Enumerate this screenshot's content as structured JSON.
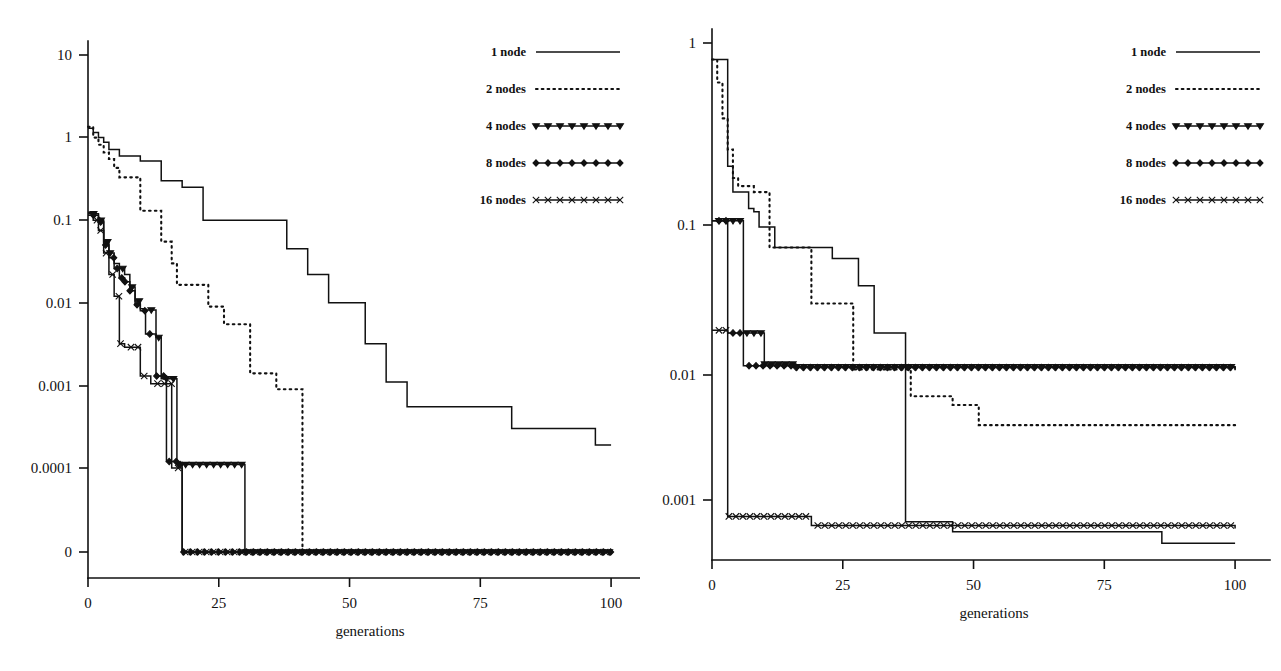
{
  "figure": {
    "background": "#ffffff",
    "ink": "#111111",
    "panels": [
      "left",
      "right"
    ]
  },
  "chart_data": [
    {
      "id": "left",
      "type": "line",
      "title": "",
      "xlabel": "generations",
      "ylabel": "",
      "xticks": [
        "0",
        "25",
        "50",
        "75",
        "100"
      ],
      "xtick_values": [
        0,
        25,
        50,
        75,
        100
      ],
      "xlim": [
        0,
        104
      ],
      "yticks": [
        "10",
        "1",
        "0.1",
        "0.01",
        "0.001",
        "0.0001",
        "0"
      ],
      "ytick_values": [
        10,
        1,
        0.1,
        0.01,
        0.001,
        0.0001,
        0
      ],
      "yscale": "log-with-zero",
      "grid": false,
      "legend_position": "top-right",
      "legend": [
        "1 node",
        "2 nodes",
        "4 nodes",
        "8 nodes",
        "16 nodes"
      ],
      "series": [
        {
          "name": "1 node",
          "style": "solid",
          "marker": "none",
          "points": [
            [
              0,
              1.3
            ],
            [
              1,
              1.15
            ],
            [
              2,
              1.0
            ],
            [
              3,
              0.88
            ],
            [
              4,
              0.72
            ],
            [
              6,
              0.6
            ],
            [
              9,
              0.6
            ],
            [
              10,
              0.52
            ],
            [
              13,
              0.52
            ],
            [
              14,
              0.3
            ],
            [
              17,
              0.3
            ],
            [
              18,
              0.25
            ],
            [
              21,
              0.25
            ],
            [
              22,
              0.1
            ],
            [
              37,
              0.1
            ],
            [
              38,
              0.045
            ],
            [
              41,
              0.045
            ],
            [
              42,
              0.022
            ],
            [
              45,
              0.022
            ],
            [
              46,
              0.01
            ],
            [
              52,
              0.01
            ],
            [
              53,
              0.0032
            ],
            [
              56,
              0.0032
            ],
            [
              57,
              0.0011
            ],
            [
              60,
              0.0011
            ],
            [
              61,
              0.00055
            ],
            [
              80,
              0.00055
            ],
            [
              81,
              0.0003
            ],
            [
              96,
              0.0003
            ],
            [
              97,
              0.00019
            ],
            [
              100,
              0.00019
            ]
          ]
        },
        {
          "name": "2 nodes",
          "style": "dotted",
          "marker": "none",
          "points": [
            [
              0,
              1.35
            ],
            [
              1,
              1.0
            ],
            [
              2,
              0.82
            ],
            [
              3,
              0.66
            ],
            [
              4,
              0.55
            ],
            [
              5,
              0.43
            ],
            [
              6,
              0.33
            ],
            [
              9,
              0.33
            ],
            [
              10,
              0.13
            ],
            [
              14,
              0.055
            ],
            [
              16,
              0.03
            ],
            [
              17,
              0.0165
            ],
            [
              22,
              0.0165
            ],
            [
              23,
              0.009
            ],
            [
              25,
              0.009
            ],
            [
              26,
              0.0055
            ],
            [
              30,
              0.0055
            ],
            [
              31,
              0.0014
            ],
            [
              35,
              0.0014
            ],
            [
              36,
              0.0009
            ],
            [
              40,
              0.0009
            ],
            [
              41,
              0.0
            ],
            [
              100,
              0.0
            ]
          ]
        },
        {
          "name": "4 nodes",
          "style": "marked",
          "marker": "triangle-down",
          "points": [
            [
              0,
              0.125
            ],
            [
              1,
              0.12
            ],
            [
              2,
              0.1
            ],
            [
              3,
              0.055
            ],
            [
              4,
              0.04
            ],
            [
              5,
              0.03
            ],
            [
              6,
              0.026
            ],
            [
              7,
              0.022
            ],
            [
              8,
              0.0155
            ],
            [
              9,
              0.0105
            ],
            [
              10,
              0.0085
            ],
            [
              11,
              0.0082
            ],
            [
              12,
              0.0082
            ],
            [
              13,
              0.0038
            ],
            [
              14,
              0.0012
            ],
            [
              16,
              0.0012
            ],
            [
              17,
              0.00011
            ],
            [
              28,
              0.00011
            ],
            [
              30,
              0.0
            ],
            [
              100,
              0.0
            ]
          ]
        },
        {
          "name": "8 nodes",
          "style": "marked",
          "marker": "diamond",
          "points": [
            [
              0,
              0.12
            ],
            [
              1,
              0.115
            ],
            [
              2,
              0.095
            ],
            [
              3,
              0.05
            ],
            [
              4,
              0.035
            ],
            [
              5,
              0.026
            ],
            [
              6,
              0.02
            ],
            [
              7,
              0.018
            ],
            [
              8,
              0.014
            ],
            [
              9,
              0.0095
            ],
            [
              10,
              0.008
            ],
            [
              11,
              0.0042
            ],
            [
              12,
              0.0042
            ],
            [
              13,
              0.0013
            ],
            [
              15,
              0.00012
            ],
            [
              17,
              0.00011
            ],
            [
              18,
              0.0
            ],
            [
              100,
              0.0
            ]
          ]
        },
        {
          "name": "16 nodes",
          "style": "marked",
          "marker": "cross",
          "points": [
            [
              0,
              0.115
            ],
            [
              1,
              0.1
            ],
            [
              2,
              0.075
            ],
            [
              3,
              0.04
            ],
            [
              4,
              0.022
            ],
            [
              5,
              0.012
            ],
            [
              6,
              0.0032
            ],
            [
              7,
              0.0029
            ],
            [
              9,
              0.0029
            ],
            [
              10,
              0.0013
            ],
            [
              12,
              0.00105
            ],
            [
              14,
              0.00105
            ],
            [
              16,
              0.0001
            ],
            [
              18,
              0.0
            ],
            [
              100,
              0.0
            ]
          ]
        }
      ]
    },
    {
      "id": "right",
      "type": "line",
      "title": "",
      "xlabel": "generations",
      "ylabel": "",
      "xticks": [
        "0",
        "25",
        "50",
        "75",
        "100"
      ],
      "xtick_values": [
        0,
        25,
        50,
        75,
        100
      ],
      "xlim": [
        0,
        104
      ],
      "yticks": [
        "1",
        "0.1",
        "0.01",
        "0.001"
      ],
      "ytick_values": [
        1,
        0.1,
        0.01,
        0.001
      ],
      "yscale": "log",
      "ylim": [
        0.0004,
        1.6
      ],
      "grid": false,
      "legend_position": "top-right",
      "legend": [
        "1 node",
        "2 nodes",
        "4 nodes",
        "8 nodes",
        "16 nodes"
      ],
      "series": [
        {
          "name": "1 node",
          "style": "solid",
          "marker": "none",
          "points": [
            [
              0,
              0.78
            ],
            [
              2,
              0.78
            ],
            [
              3,
              0.155
            ],
            [
              4,
              0.105
            ],
            [
              6,
              0.105
            ],
            [
              7,
              0.082
            ],
            [
              8,
              0.078
            ],
            [
              9,
              0.062
            ],
            [
              11,
              0.062
            ],
            [
              12,
              0.0455
            ],
            [
              22,
              0.0455
            ],
            [
              23,
              0.0385
            ],
            [
              27,
              0.0385
            ],
            [
              28,
              0.0255
            ],
            [
              30,
              0.0255
            ],
            [
              31,
              0.0125
            ],
            [
              36,
              0.0125
            ],
            [
              37,
              0.00072
            ],
            [
              44,
              0.00072
            ],
            [
              46,
              0.00062
            ],
            [
              84,
              0.00062
            ],
            [
              86,
              0.00052
            ],
            [
              100,
              0.00052
            ]
          ]
        },
        {
          "name": "2 nodes",
          "style": "dotted",
          "marker": "none",
          "points": [
            [
              0,
              0.78
            ],
            [
              1,
              0.55
            ],
            [
              2,
              0.32
            ],
            [
              3,
              0.2
            ],
            [
              4,
              0.13
            ],
            [
              5,
              0.115
            ],
            [
              7,
              0.115
            ],
            [
              8,
              0.105
            ],
            [
              10,
              0.105
            ],
            [
              11,
              0.0455
            ],
            [
              18,
              0.0455
            ],
            [
              19,
              0.0195
            ],
            [
              26,
              0.0195
            ],
            [
              27,
              0.0072
            ],
            [
              37,
              0.0072
            ],
            [
              38,
              0.0048
            ],
            [
              44,
              0.0048
            ],
            [
              46,
              0.0042
            ],
            [
              50,
              0.0042
            ],
            [
              51,
              0.0031
            ],
            [
              100,
              0.0031
            ]
          ]
        },
        {
          "name": "4 nodes",
          "style": "marked",
          "marker": "triangle-down",
          "points": [
            [
              0,
              0.068
            ],
            [
              5,
              0.068
            ],
            [
              6,
              0.0125
            ],
            [
              9,
              0.0125
            ],
            [
              10,
              0.0078
            ],
            [
              14,
              0.0078
            ],
            [
              16,
              0.0075
            ],
            [
              100,
              0.0072
            ]
          ]
        },
        {
          "name": "8 nodes",
          "style": "marked",
          "marker": "diamond",
          "points": [
            [
              0,
              0.068
            ],
            [
              2,
              0.068
            ],
            [
              3,
              0.0125
            ],
            [
              5,
              0.0125
            ],
            [
              6,
              0.0076
            ],
            [
              13,
              0.0076
            ],
            [
              16,
              0.0074
            ],
            [
              100,
              0.0071
            ]
          ]
        },
        {
          "name": "16 nodes",
          "style": "marked",
          "marker": "cross",
          "points": [
            [
              0,
              0.013
            ],
            [
              2,
              0.013
            ],
            [
              3,
              0.00078
            ],
            [
              18,
              0.00078
            ],
            [
              19,
              0.00068
            ],
            [
              100,
              0.00065
            ]
          ]
        }
      ]
    }
  ]
}
